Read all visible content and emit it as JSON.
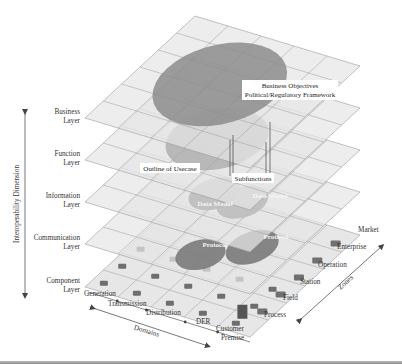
{
  "diagram": {
    "axes": {
      "vertical": "Interoperability Dimension",
      "domains": "Domains",
      "zones": "Zones"
    },
    "layers": [
      {
        "line1": "Business",
        "line2": "Layer"
      },
      {
        "line1": "Function",
        "line2": "Layer"
      },
      {
        "line1": "Information",
        "line2": "Layer"
      },
      {
        "line1": "Communication",
        "line2": "Layer"
      },
      {
        "line1": "Component",
        "line2": "Layer"
      }
    ],
    "domains": [
      "Generation",
      "Transmission",
      "Distribution",
      "DER",
      "Customer",
      "Premise"
    ],
    "zones": [
      "Process",
      "Field",
      "Station",
      "Operation",
      "Enterprise",
      "Market"
    ],
    "callouts": {
      "business_objectives_1": "Business Objectives",
      "business_objectives_2": "Political/Regulatory Framework",
      "outline_of_usecase": "Outline of Usecase",
      "subfunctions": "Subfunctions",
      "data_model_1": "Data Model",
      "data_model_2": "Data Model",
      "protocol_1": "Protocol",
      "protocol_2": "Protocol"
    },
    "colors": {
      "plane_fill": "#e6e6e6",
      "grid_line": "#9a9a9a",
      "business_blob": "#8c8c8c",
      "function_blob": "#a8a8a8",
      "data_model_blob": "#bcbcbc",
      "protocol_blob": "#7a7a7a"
    }
  }
}
